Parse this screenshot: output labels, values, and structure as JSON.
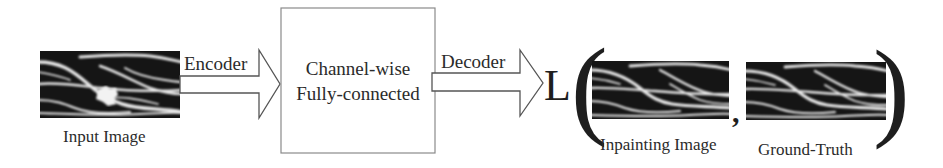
{
  "diagram": {
    "nodes": {
      "input_image": {
        "label": "Input Image",
        "has_hole": true
      },
      "fc_layer": {
        "line1": "Channel-wise",
        "line2": "Fully-connected"
      },
      "inpainting_image": {
        "label": "Inpainting Image"
      },
      "ground_truth": {
        "label": "Ground-Truth"
      }
    },
    "edges": [
      {
        "from": "input_image",
        "to": "fc_layer",
        "label": "Encoder"
      },
      {
        "from": "fc_layer",
        "to": "loss",
        "label": "Decoder"
      }
    ],
    "loss": {
      "symbol": "L",
      "open_paren": "(",
      "separator": ",",
      "close_paren": ")"
    },
    "colors": {
      "image_bg": "#151515",
      "strand": "#e8e8e8",
      "hole": "#f2f2f2",
      "text": "#2b2b2b",
      "box_stroke": "#8a8a8a",
      "arrow_stroke": "#555555"
    }
  }
}
